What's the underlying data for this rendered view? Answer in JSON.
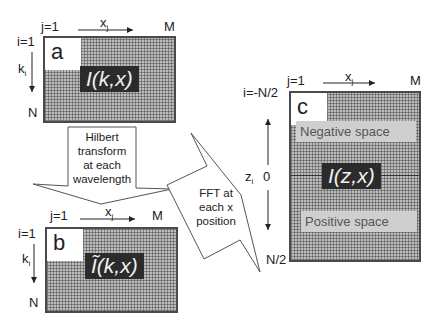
{
  "panel_a": {
    "letter": "a",
    "label": "I(k,x)",
    "col_start": "j=1",
    "col_axis": "x",
    "col_axis_sub": "j",
    "col_end": "M",
    "row_start": "i=1",
    "row_axis": "k",
    "row_axis_sub": "i",
    "row_end": "N"
  },
  "panel_b": {
    "letter": "b",
    "label": "Ĩ(k,x)",
    "col_start": "j=1",
    "col_axis": "x",
    "col_axis_sub": "j",
    "col_end": "M",
    "row_start": "i=1",
    "row_axis": "k",
    "row_axis_sub": "i",
    "row_end": "N"
  },
  "panel_c": {
    "letter": "c",
    "label": "I(z,x)",
    "col_start": "j=1",
    "col_axis": "x",
    "col_axis_sub": "j",
    "col_end": "M",
    "row_start": "i=-N/2",
    "row_axis": "z",
    "row_axis_sub": "i",
    "row_mid": "0",
    "row_end": "N/2",
    "negative_label": "Negative space",
    "positive_label": "Positive space"
  },
  "arrows": {
    "hilbert": [
      "Hilbert",
      "transform",
      "at each",
      "wavelength"
    ],
    "fft": [
      "FFT at",
      "each x",
      "position"
    ]
  }
}
